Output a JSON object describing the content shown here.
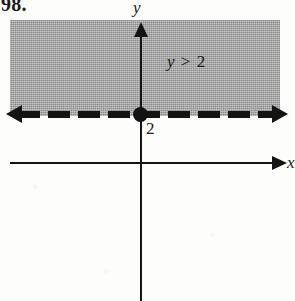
{
  "figure": {
    "problem_number": "98.",
    "caption_inequality": "y > 2"
  },
  "axes": {
    "y_label": "y",
    "x_label": "x",
    "y_arrow_icon": "arrow-up-icon",
    "x_arrow_icon": "arrow-right-icon"
  },
  "boundary": {
    "style": "dashed",
    "left_arrow_icon": "arrow-left-icon",
    "right_arrow_icon": "arrow-right-icon",
    "intercept_label": "2",
    "intercept_point_icon": "filled-dot-icon"
  },
  "annotation": {
    "variable": "y",
    "operator": ">",
    "value": "2"
  },
  "colors": {
    "ink": "#141414",
    "shading": "#a9a9a9",
    "page": "#fdfdfc"
  },
  "chart_data": {
    "type": "area",
    "xlabel": "x",
    "ylabel": "y",
    "inequality": "y > 2",
    "boundary_line": {
      "equation": "y = 2",
      "y_value": 2,
      "line_style": "dashed",
      "included_in_solution": false,
      "extends": "infinite in both x directions"
    },
    "shaded_region": {
      "description": "half-plane above the boundary line",
      "condition": "y > 2",
      "fill": "#a9a9a9"
    },
    "marked_points": [
      {
        "label": "2",
        "x": 0,
        "y": 2,
        "style": "filled-dot"
      }
    ],
    "grid": false,
    "legend": false,
    "annotations": [
      {
        "text": "y > 2",
        "x": 2.2,
        "y": 4.6
      }
    ]
  }
}
